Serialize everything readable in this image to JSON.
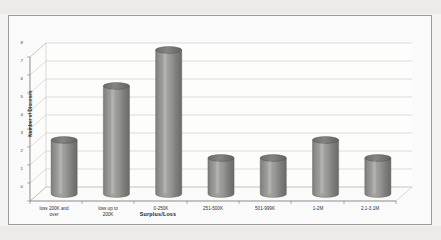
{
  "chart_data": {
    "type": "bar",
    "title": "",
    "subtitle": "",
    "xlabel": "Surplus/Loss",
    "ylabel": "Number of Dioceses",
    "categories": [
      "loss 200K and\nover",
      "loss up to\n200K",
      "0-250K",
      "251-500K",
      "501-999K",
      "1-2M",
      "2.1-3.1M"
    ],
    "values": [
      3,
      6,
      8,
      2,
      2,
      3,
      2
    ],
    "ylim": [
      0,
      8
    ],
    "yticks": [
      "0",
      "1",
      "2",
      "3",
      "4",
      "5",
      "6",
      "7",
      "8"
    ],
    "grid": true,
    "legend": "none",
    "style": "3d-cylinder",
    "series": [
      {
        "name": "Number of Dioceses",
        "values": [
          3,
          6,
          8,
          2,
          2,
          3,
          2
        ]
      }
    ],
    "colors": {
      "bar_fill": "#8a8a88",
      "bar_fill_light": "#a9a9a6",
      "bar_fill_dark": "#6e6e6c",
      "bar_top": "#6f6f6d",
      "gridline": "#b9b9b9",
      "axis": "#7c7c7c",
      "plot_background": "#fdfdfc",
      "page_background": "#f4f3f1",
      "frame_border": "#9b9b9b",
      "text": "#2b2b2b"
    }
  }
}
